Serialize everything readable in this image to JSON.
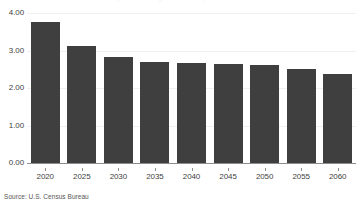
{
  "chart_data": {
    "type": "bar",
    "title": "Projected Average Annual Population Growth",
    "subtitle": "",
    "xlabel": "",
    "ylabel": "",
    "categories": [
      "2020",
      "2025",
      "2030",
      "2035",
      "2040",
      "2045",
      "2050",
      "2055",
      "2060"
    ],
    "values": [
      3.76,
      3.12,
      2.82,
      2.7,
      2.66,
      2.64,
      2.61,
      2.51,
      2.38
    ],
    "ylim": [
      0.0,
      4.0
    ],
    "ytick_labels": [
      "0.00",
      "1.00",
      "2.00",
      "3.00",
      "4.00"
    ],
    "ytick_values": [
      0.0,
      1.0,
      2.0,
      3.0,
      4.0
    ],
    "grid": true,
    "legend": null,
    "legend_position": "none",
    "series": [
      {
        "name": "Projection",
        "values": [
          3.76,
          3.12,
          2.82,
          2.7,
          2.66,
          2.64,
          2.61,
          2.51,
          2.38
        ]
      }
    ],
    "bar_color": "#3f3f3f",
    "gridline_color": "#f0f0f2",
    "axis_color": "#8d8d8d",
    "background_color": "#ffffff"
  },
  "footer": {
    "source": "Source: U.S. Census Bureau"
  }
}
